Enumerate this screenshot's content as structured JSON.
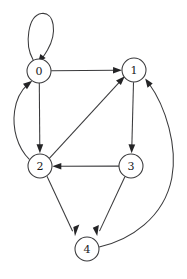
{
  "diagram": {
    "type": "directed-graph",
    "background_color": "#ffffff",
    "stroke_color": "#3a3a3c",
    "arrow_color": "#242426",
    "label_color": "#1a1a1c",
    "node_fill": "#ffffff",
    "node_radius": 12,
    "nodes": [
      {
        "id": "0",
        "label": "0",
        "cx": 39,
        "cy": 71
      },
      {
        "id": "1",
        "label": "1",
        "cx": 134,
        "cy": 70
      },
      {
        "id": "2",
        "label": "2",
        "cx": 40,
        "cy": 166
      },
      {
        "id": "3",
        "label": "3",
        "cx": 131,
        "cy": 166
      },
      {
        "id": "4",
        "label": "4",
        "cx": 87,
        "cy": 249
      }
    ],
    "edges": [
      {
        "id": "e-0-0",
        "from": "0",
        "to": "0",
        "shape": "self-loop",
        "directed": true
      },
      {
        "id": "e-0-1",
        "from": "0",
        "to": "1",
        "shape": "straight",
        "directed": true
      },
      {
        "id": "e-0-2",
        "from": "0",
        "to": "2",
        "shape": "straight",
        "directed": true
      },
      {
        "id": "e-2-0",
        "from": "2",
        "to": "0",
        "shape": "curve-left",
        "directed": true
      },
      {
        "id": "e-2-1",
        "from": "2",
        "to": "1",
        "shape": "straight",
        "directed": true
      },
      {
        "id": "e-2-4",
        "from": "2",
        "to": "4",
        "shape": "straight",
        "directed": true
      },
      {
        "id": "e-1-3",
        "from": "1",
        "to": "3",
        "shape": "straight",
        "directed": true
      },
      {
        "id": "e-3-2",
        "from": "3",
        "to": "2",
        "shape": "straight",
        "directed": true
      },
      {
        "id": "e-3-4",
        "from": "3",
        "to": "4",
        "shape": "straight",
        "directed": true
      },
      {
        "id": "e-4-1",
        "from": "4",
        "to": "1",
        "shape": "curve-right",
        "directed": true
      }
    ]
  }
}
